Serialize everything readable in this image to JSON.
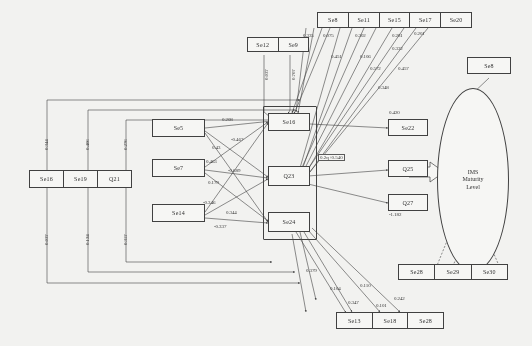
{
  "diagram": {
    "type": "structural-equation-model-path-diagram",
    "latent": {
      "label": "IMS\nMaturity\nLevel",
      "line1": "IMS",
      "line2": "Maturity",
      "line3": "Level"
    },
    "equation_label": "0.2q+0.540",
    "nodes": {
      "top_group": [
        "Se8",
        "Se11",
        "Se15",
        "Se17",
        "Se20"
      ],
      "top_left_group": [
        "Se12",
        "Se9"
      ],
      "top_right_single": "Se8",
      "left_group": [
        "Se16",
        "Se19",
        "Q21"
      ],
      "left_indicators": [
        "Se5",
        "Se7",
        "Se14"
      ],
      "center_column": [
        "Se16",
        "Q23",
        "Se24"
      ],
      "right_column": [
        "Se22",
        "Q25",
        "Q27"
      ],
      "bottom_right_group": [
        "Se28",
        "Se29",
        "Se30"
      ],
      "bottom_group": [
        "Se13",
        "Se18",
        "Se28"
      ]
    },
    "coefficients": {
      "se5_to_se16": "0.208",
      "se5_a": "0.43",
      "se5_b": "-0.467",
      "se7_a": "0.463",
      "se7_b": "-0.689",
      "se7_c": "0.179",
      "se14_a": "-0.346",
      "se14_b": "0.344",
      "se14_c": "-0.337",
      "left_v1": "0.344",
      "left_v2": "0.406",
      "left_v3": "0.276",
      "left_v4": "0.037",
      "left_v5": "0.124",
      "left_v6": "0.357",
      "top_1": "0.335",
      "top_2": "0.075",
      "top_3": "0.302",
      "top_4": "0.281",
      "top_5": "0.201",
      "top_6": "0.451",
      "top_7": "0.106",
      "top_8": "0.332",
      "top_9": "0.572",
      "top_10": "0.457",
      "top_11": "0.348",
      "se22_in": "0.420",
      "q27_in": "-1.182",
      "bot_1": "0.379",
      "bot_2": "0.104",
      "bot_3": "0.347",
      "bot_4": "0.110",
      "bot_5": "0.101",
      "bot_6": "0.242",
      "se12_v": "0.037",
      "se9_v": "0.707"
    }
  }
}
